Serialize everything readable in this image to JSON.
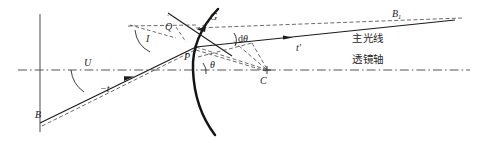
{
  "figure": {
    "background_color": "#ffffff",
    "stroke_color": "#1b1b1b",
    "width": 478,
    "height": 141
  },
  "labels": {
    "object_point": "B",
    "image_point_base": "B",
    "image_point_sub": "1",
    "incident_angle": "I",
    "aux_point_q": "Q",
    "aux_point_q_prime": "̇",
    "surface_point_g": "G",
    "vertex_point_p": "P",
    "center_point_c": "C",
    "slope_angle_u": "U",
    "object_distance": "−t",
    "image_distance": "t′",
    "theta": "θ",
    "d_theta_prefix": "d",
    "d_theta_symbol": "θ",
    "principal_ray": "主光线",
    "lens_axis": "透镜轴"
  },
  "geometry": {
    "axis_y": 70,
    "vertical_line_x": 40,
    "vertex_x": 200,
    "center_x": 267,
    "object_x": 40,
    "object_y": 123,
    "hit_point_x": 196,
    "hit_point_y": 48
  },
  "colors": {
    "ink": "#1b1b1b",
    "ink_light": "#3a3a3a",
    "axis": "#555555",
    "text": "#262626"
  }
}
